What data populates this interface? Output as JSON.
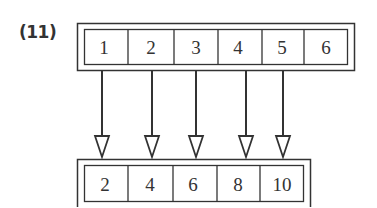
{
  "label": "(11)",
  "top_array": {
    "values": [
      "1",
      "2",
      "3",
      "4",
      "5",
      "6"
    ],
    "dividers_x": [
      128,
      174,
      218,
      262,
      304
    ],
    "cell_centers_x": [
      104,
      151,
      196,
      238,
      282,
      326
    ]
  },
  "bottom_array": {
    "values": [
      "2",
      "4",
      "6",
      "8",
      "10"
    ],
    "dividers_x": [
      128,
      173,
      217,
      260
    ],
    "cell_centers_x": [
      105,
      150,
      193,
      238,
      282
    ]
  },
  "arrows": [
    {
      "from": "1",
      "to": "2",
      "x": 102
    },
    {
      "from": "2",
      "to": "4",
      "x": 152
    },
    {
      "from": "3",
      "to": "6",
      "x": 196
    },
    {
      "from": "4",
      "to": "8",
      "x": 246
    },
    {
      "from": "5",
      "to": "10",
      "x": 283
    }
  ],
  "colors": {
    "stroke": "#333333",
    "background": "#ffffff"
  }
}
